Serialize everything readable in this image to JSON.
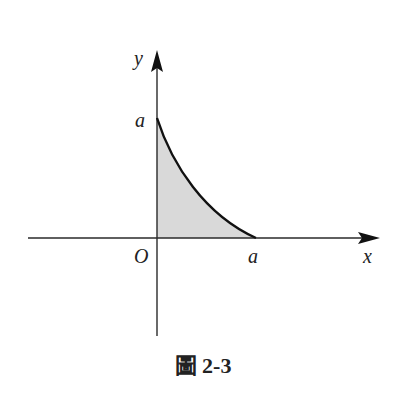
{
  "figure": {
    "caption": "圖 2-3",
    "labels": {
      "y_axis": "y",
      "x_axis": "x",
      "origin": "O",
      "y_intercept": "a",
      "x_intercept": "a"
    },
    "colors": {
      "axis": "#2a2a2a",
      "curve": "#111111",
      "fill": "#d9d9d9"
    }
  }
}
